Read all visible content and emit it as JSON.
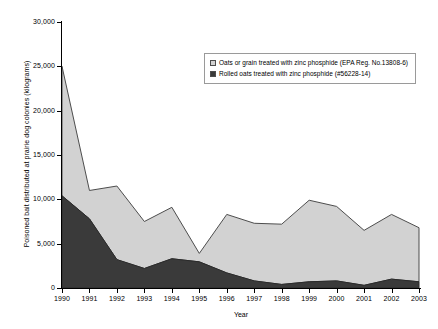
{
  "chart_data": {
    "type": "area",
    "stacked": true,
    "title": "",
    "xlabel": "Year",
    "ylabel": "Poisoned bait distributed at prairie dog colonies (kilograms)",
    "categories": [
      "1990",
      "1991",
      "1992",
      "1993",
      "1994",
      "1995",
      "1996",
      "1997",
      "1998",
      "1999",
      "2000",
      "2001",
      "2002",
      "2003"
    ],
    "x": [
      1990,
      1991,
      1992,
      1993,
      1994,
      1995,
      1996,
      1997,
      1998,
      1999,
      2000,
      2001,
      2002,
      2003
    ],
    "series": [
      {
        "name": "Rolled oats treated with zinc phosphide (#56228-14)",
        "color": "#3a3a3a",
        "values": [
          10400,
          7800,
          3200,
          2200,
          3300,
          2950,
          1700,
          800,
          400,
          700,
          800,
          300,
          1000,
          700
        ]
      },
      {
        "name": "Oats or grain treated with zinc phosphide (EPA Reg. No.13808-6)",
        "color": "#d2d2d2",
        "values": [
          14600,
          3200,
          8300,
          5300,
          5800,
          950,
          6600,
          6500,
          6800,
          9200,
          8400,
          6200,
          7300,
          6100
        ]
      }
    ],
    "totals": [
      25000,
      11000,
      11500,
      7500,
      9100,
      3900,
      8300,
      7300,
      7200,
      9900,
      9200,
      6500,
      8300,
      6800
    ],
    "ylim": [
      0,
      30000
    ],
    "yticks": [
      0,
      5000,
      10000,
      15000,
      20000,
      25000,
      30000
    ],
    "ytick_labels": [
      "0",
      "5,000",
      "10,000",
      "15,000",
      "20,000",
      "25,000",
      "30,000"
    ],
    "grid": false,
    "legend_position": "upper-right-inside"
  },
  "legend": {
    "items": [
      {
        "label": "Oats or grain treated with zinc phosphide (EPA Reg. No.13808-6)",
        "swatch": "light"
      },
      {
        "label": "Rolled oats treated with zinc phosphide (#56228-14)",
        "swatch": "dark"
      }
    ]
  },
  "axes": {
    "x_title": "Year",
    "y_title": "Poisoned bait distributed at prairie dog colonies (kilograms)"
  }
}
